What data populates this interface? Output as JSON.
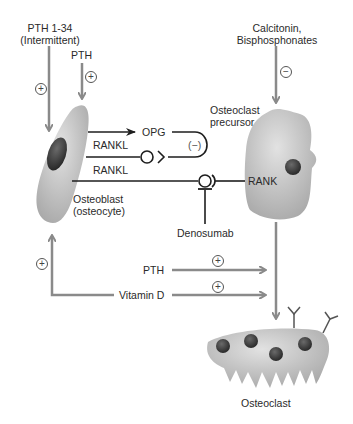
{
  "diagram": {
    "title": "",
    "colors": {
      "arrow_gray": "#8a8a8a",
      "line_black": "#1e1e1e",
      "cell_fill": "#bdbdbd",
      "nucleus": "#3a3a3a",
      "background": "#ffffff"
    },
    "inputs": {
      "pth_134": {
        "line1": "PTH 1-34",
        "line2": "(Intermittent)",
        "sign": "+"
      },
      "pth_top": {
        "label": "PTH",
        "sign": "+"
      },
      "calcitonin": {
        "line1": "Calcitonin,",
        "line2": "Bisphosphonates",
        "sign": "−"
      }
    },
    "cells": {
      "osteoblast": {
        "line1": "Osteoblast",
        "line2": "(osteocyte)"
      },
      "osteoclast_precursor": {
        "line1": "Osteoclast",
        "line2": "precursor"
      },
      "osteoclast": {
        "label": "Osteoclast"
      }
    },
    "signals": {
      "opg": "OPG",
      "opg_feedback": "(−)",
      "rankl_1": "RANKL",
      "rankl_2": "RANKL",
      "rank": "RANK",
      "denosumab": "Denosumab"
    },
    "lower_inputs": {
      "pth": {
        "label": "PTH",
        "sign": "+"
      },
      "vitamin_d": {
        "label": "Vitamin D",
        "sign": "+"
      },
      "osteoblast_feedback_sign": "+"
    }
  }
}
